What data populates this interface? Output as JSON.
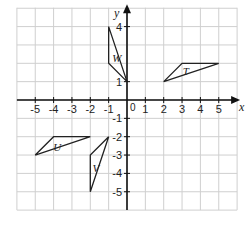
{
  "diagram": {
    "type": "coordinate-grid",
    "axes": {
      "x_label": "x",
      "y_label": "y",
      "origin_label": "0",
      "x_ticks": [
        {
          "value": -5,
          "label": "-5"
        },
        {
          "value": -4,
          "label": "-4"
        },
        {
          "value": -3,
          "label": "-3"
        },
        {
          "value": -2,
          "label": "-2"
        },
        {
          "value": -1,
          "label": "-1"
        },
        {
          "value": 1,
          "label": "1"
        },
        {
          "value": 2,
          "label": "2"
        },
        {
          "value": 3,
          "label": "3"
        },
        {
          "value": 4,
          "label": "4"
        },
        {
          "value": 5,
          "label": "5"
        }
      ],
      "y_ticks": [
        {
          "value": 4,
          "label": "4"
        },
        {
          "value": 1,
          "label": "1"
        },
        {
          "value": -1,
          "label": "-1"
        },
        {
          "value": -2,
          "label": "-2"
        },
        {
          "value": -3,
          "label": "-3"
        },
        {
          "value": -4,
          "label": "-4"
        },
        {
          "value": -5,
          "label": "-5"
        }
      ],
      "x_range": [
        -6,
        6
      ],
      "y_range": [
        -6,
        5
      ]
    },
    "shapes": [
      {
        "name": "W",
        "label": "W",
        "vertices": [
          [
            -1,
            4
          ],
          [
            -1,
            2
          ],
          [
            0,
            1
          ]
        ],
        "label_pos": [
          -0.55,
          2.3
        ]
      },
      {
        "name": "T",
        "label": "T",
        "vertices": [
          [
            2,
            1
          ],
          [
            3,
            2
          ],
          [
            5,
            2
          ]
        ],
        "label_pos": [
          3.2,
          1.6
        ]
      },
      {
        "name": "U",
        "label": "U",
        "vertices": [
          [
            -5,
            -3
          ],
          [
            -4,
            -2
          ],
          [
            -2,
            -2
          ]
        ],
        "label_pos": [
          -3.8,
          -2.55
        ]
      },
      {
        "name": "V",
        "label": "V",
        "vertices": [
          [
            -1,
            -2
          ],
          [
            -2,
            -3
          ],
          [
            -2,
            -5
          ]
        ],
        "label_pos": [
          -1.7,
          -3.7
        ]
      }
    ],
    "colors": {
      "grid": "#cfcfcf",
      "axis": "#111111",
      "shape": "#222222"
    }
  }
}
